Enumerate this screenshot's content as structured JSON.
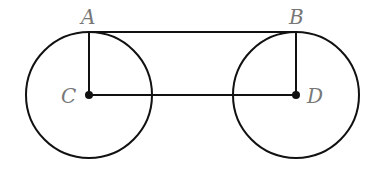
{
  "diagram": {
    "type": "geometry",
    "points": {
      "A": {
        "label": "A",
        "x": 89,
        "y": 32
      },
      "B": {
        "label": "B",
        "x": 296,
        "y": 32
      },
      "C": {
        "label": "C",
        "x": 89,
        "y": 95
      },
      "D": {
        "label": "D",
        "x": 296,
        "y": 95
      }
    },
    "circles": [
      {
        "center": "C",
        "radius": 63
      },
      {
        "center": "D",
        "radius": 63
      }
    ],
    "segments": [
      [
        "A",
        "B"
      ],
      [
        "A",
        "C"
      ],
      [
        "B",
        "D"
      ],
      [
        "C",
        "D"
      ]
    ],
    "stroke_color": "#111111",
    "label_color": "#777777"
  }
}
